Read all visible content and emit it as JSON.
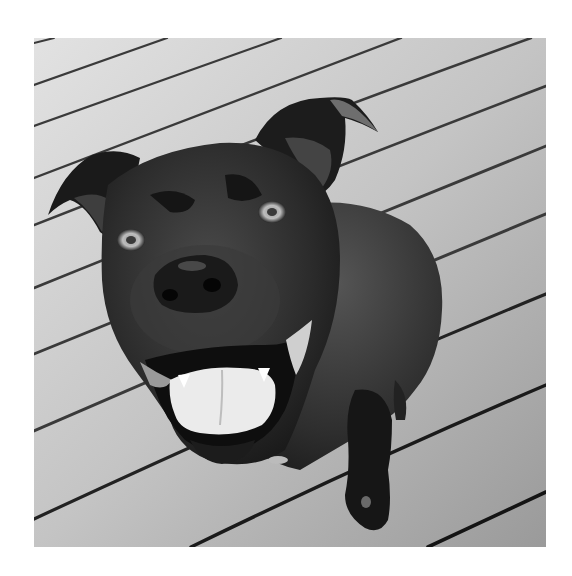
{
  "image": {
    "subject": "black dog sitting on a wooden deck looking up at camera",
    "style": "grayscale photograph",
    "frame": {
      "x": 34,
      "y": 38,
      "width": 512,
      "height": 509
    },
    "colors": {
      "page_background": "#ffffff",
      "deck_light": "#dcdcdc",
      "deck_dark": "#9a9a9a",
      "deck_gap": "#2a2a2a",
      "dog_fur": "#262626",
      "dog_highlight": "#5a5a5a",
      "tongue": "#eeeeee"
    }
  }
}
